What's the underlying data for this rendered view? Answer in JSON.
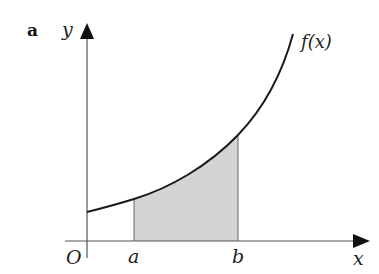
{
  "figure": {
    "panel_label": "a",
    "axes": {
      "y_label": "y",
      "x_label": "x",
      "origin_label": "O"
    },
    "curve_label": "f(x)",
    "bounds": {
      "lower": "a",
      "upper": "b"
    },
    "colors": {
      "curve": "#1a1a1a",
      "axis": "#555555",
      "shade": "#d4d4d4",
      "bound_line": "#666666"
    }
  }
}
